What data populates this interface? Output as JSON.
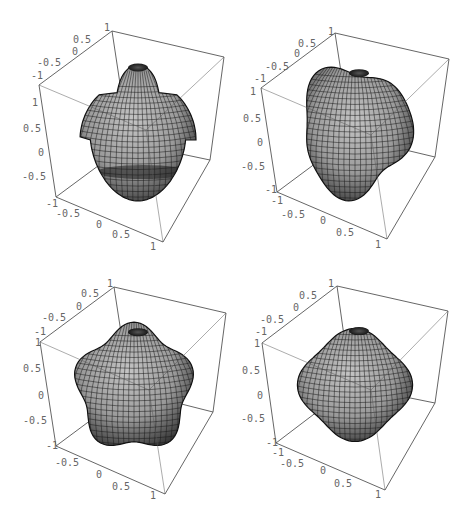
{
  "chart_data": [
    {
      "type": "surface3d",
      "title": "",
      "panel": "top-left",
      "description": "Spherical-harmonic-like 3D surface: mushroom/bell shape with top knob and lower lobe",
      "xlabel": "",
      "ylabel": "",
      "zlabel": "",
      "xlim": [
        -1,
        1
      ],
      "ylim": [
        -1,
        1
      ],
      "zlim": [
        -1,
        1
      ],
      "x_ticks": [
        "-1",
        "-0.5",
        "0",
        "0.5",
        "1"
      ],
      "y_ticks": [
        "-1",
        "-0.5",
        "0",
        "0.5",
        "1"
      ],
      "z_ticks": [
        "1",
        "0.5",
        "0",
        "-0.5",
        "-1"
      ],
      "surface_color": "#a9a9a9",
      "mesh": true
    },
    {
      "type": "surface3d",
      "title": "",
      "panel": "top-right",
      "description": "Lumpy tilted blob surface with dimpled top",
      "xlim": [
        -1,
        1
      ],
      "ylim": [
        -1,
        1
      ],
      "zlim": [
        -1,
        1
      ],
      "x_ticks": [
        "-1",
        "-0.5",
        "0",
        "0.5",
        "1"
      ],
      "y_ticks": [
        "-1",
        "-0.5",
        "0",
        "0.5",
        "1"
      ],
      "z_ticks": [
        "1",
        "0.5",
        "0",
        "-0.5",
        "-1"
      ],
      "surface_color": "#a9a9a9",
      "mesh": true
    },
    {
      "type": "surface3d",
      "title": "",
      "panel": "bottom-left",
      "description": "Rounded cube/pentagonal lobed surface with dimpled top",
      "xlim": [
        -1,
        1
      ],
      "ylim": [
        -1,
        1
      ],
      "zlim": [
        -1,
        1
      ],
      "x_ticks": [
        "-0.5",
        "0",
        "0.5",
        "1"
      ],
      "y_ticks": [
        "-1",
        "-0.5",
        "0",
        "0.5",
        "1"
      ],
      "z_ticks": [
        "1",
        "0.5",
        "0",
        "-0.5",
        "-1"
      ],
      "surface_color": "#a9a9a9",
      "mesh": true
    },
    {
      "type": "surface3d",
      "title": "",
      "panel": "bottom-right",
      "description": "Four-lobed rounded surface with dimpled top",
      "xlim": [
        -1,
        1
      ],
      "ylim": [
        -1,
        1
      ],
      "zlim": [
        -1,
        1
      ],
      "x_ticks": [
        "-1",
        "-0.5",
        "0",
        "0.5",
        "1"
      ],
      "y_ticks": [
        "-1",
        "-0.5",
        "0",
        "0.5",
        "1"
      ],
      "z_ticks": [
        "1",
        "0.5",
        "0",
        "-0.5",
        "-1"
      ],
      "surface_color": "#a9a9a9",
      "mesh": true
    }
  ],
  "plots": [
    {
      "box": {
        "tbl": [
          112,
          31
        ],
        "tbr": [
          224,
          57
        ],
        "tfl": [
          39,
          85
        ],
        "bfl": [
          56,
          197
        ],
        "bfr": [
          163,
          242
        ],
        "bbr": [
          210,
          160
        ]
      },
      "top_ticks": [
        {
          "t": "1",
          "x": 104,
          "y": 31
        },
        {
          "t": "0.5",
          "x": 73,
          "y": 43
        },
        {
          "t": "0",
          "x": 72,
          "y": 55
        },
        {
          "t": "-0.5",
          "x": 37,
          "y": 66
        },
        {
          "t": "-1",
          "x": 31,
          "y": 79
        }
      ],
      "z_ticks": [
        {
          "t": "1",
          "x": 32,
          "y": 106
        },
        {
          "t": "0.5",
          "x": 23,
          "y": 132
        },
        {
          "t": "0",
          "x": 38,
          "y": 156
        },
        {
          "t": "-0.5",
          "x": 22,
          "y": 180
        },
        {
          "t": "-1",
          "x": 46,
          "y": 207
        }
      ],
      "bottom_ticks": [
        {
          "t": "-0.5",
          "x": 56,
          "y": 217
        },
        {
          "t": "0",
          "x": 96,
          "y": 228
        },
        {
          "t": "0.5",
          "x": 112,
          "y": 238
        },
        {
          "t": "1",
          "x": 150,
          "y": 250
        }
      ]
    },
    {
      "box": {
        "tbl": [
          335,
          33
        ],
        "tbr": [
          449,
          59
        ],
        "tfl": [
          261,
          88
        ],
        "bfl": [
          277,
          192
        ],
        "bfr": [
          387,
          239
        ],
        "bbr": [
          435,
          157
        ]
      },
      "top_ticks": [
        {
          "t": "1",
          "x": 328,
          "y": 35
        },
        {
          "t": "0.5",
          "x": 298,
          "y": 47
        },
        {
          "t": "0",
          "x": 294,
          "y": 57
        },
        {
          "t": "-0.5",
          "x": 265,
          "y": 70
        },
        {
          "t": "-1",
          "x": 254,
          "y": 82
        }
      ],
      "z_ticks": [
        {
          "t": "1",
          "x": 250,
          "y": 95
        },
        {
          "t": "0.5",
          "x": 243,
          "y": 122
        },
        {
          "t": "0",
          "x": 257,
          "y": 146
        },
        {
          "t": "-0.5",
          "x": 241,
          "y": 170
        },
        {
          "t": "-1",
          "x": 265,
          "y": 193
        }
      ],
      "bottom_ticks": [
        {
          "t": "-1",
          "x": 271,
          "y": 204
        },
        {
          "t": "-0.5",
          "x": 281,
          "y": 218
        },
        {
          "t": "0",
          "x": 320,
          "y": 224
        },
        {
          "t": "0.5",
          "x": 336,
          "y": 236
        },
        {
          "t": "1",
          "x": 375,
          "y": 248
        }
      ]
    },
    {
      "box": {
        "tbl": [
          114,
          287
        ],
        "tbr": [
          226,
          313
        ],
        "tfl": [
          40,
          342
        ],
        "bfl": [
          56,
          446
        ],
        "bfr": [
          165,
          494
        ],
        "bbr": [
          213,
          412
        ]
      },
      "top_ticks": [
        {
          "t": "1",
          "x": 107,
          "y": 287
        },
        {
          "t": "0.5",
          "x": 81,
          "y": 297
        },
        {
          "t": "0",
          "x": 76,
          "y": 310
        },
        {
          "t": "-0.5",
          "x": 42,
          "y": 321
        },
        {
          "t": "-1",
          "x": 34,
          "y": 335
        }
      ],
      "z_ticks": [
        {
          "t": "1",
          "x": 35,
          "y": 346
        },
        {
          "t": "0.5",
          "x": 23,
          "y": 372
        },
        {
          "t": "0",
          "x": 38,
          "y": 399
        },
        {
          "t": "-0.5",
          "x": 23,
          "y": 424
        },
        {
          "t": "-1",
          "x": 46,
          "y": 449
        }
      ],
      "bottom_ticks": [
        {
          "t": "-0.5",
          "x": 55,
          "y": 466
        },
        {
          "t": "0",
          "x": 96,
          "y": 478
        },
        {
          "t": "0.5",
          "x": 112,
          "y": 490
        },
        {
          "t": "1",
          "x": 150,
          "y": 499
        }
      ]
    },
    {
      "box": {
        "tbl": [
          337,
          286
        ],
        "tbr": [
          448,
          311
        ],
        "tfl": [
          262,
          343
        ],
        "bfl": [
          276,
          443
        ],
        "bfr": [
          385,
          490
        ],
        "bbr": [
          435,
          403
        ]
      },
      "top_ticks": [
        {
          "t": "1",
          "x": 328,
          "y": 287
        },
        {
          "t": "0.5",
          "x": 299,
          "y": 299
        },
        {
          "t": "0",
          "x": 293,
          "y": 311
        },
        {
          "t": "-0.5",
          "x": 260,
          "y": 323
        },
        {
          "t": "-1",
          "x": 255,
          "y": 335
        }
      ],
      "z_ticks": [
        {
          "t": "1",
          "x": 254,
          "y": 347
        },
        {
          "t": "0.5",
          "x": 242,
          "y": 374
        },
        {
          "t": "0",
          "x": 257,
          "y": 399
        },
        {
          "t": "-0.5",
          "x": 241,
          "y": 422
        },
        {
          "t": "-1",
          "x": 266,
          "y": 446
        }
      ],
      "bottom_ticks": [
        {
          "t": "-1",
          "x": 272,
          "y": 456
        },
        {
          "t": "-0.5",
          "x": 280,
          "y": 467
        },
        {
          "t": "0",
          "x": 320,
          "y": 474
        },
        {
          "t": "0.5",
          "x": 334,
          "y": 487
        },
        {
          "t": "1",
          "x": 375,
          "y": 498
        }
      ]
    }
  ]
}
